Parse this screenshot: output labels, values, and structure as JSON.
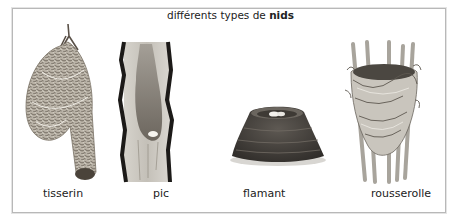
{
  "title": {
    "prefix": "différents types de",
    "emphasis": "nids"
  },
  "nests": [
    {
      "id": "weaver",
      "label": "tisserin",
      "icon": "hanging-woven-nest"
    },
    {
      "id": "woodpecker",
      "label": "pic",
      "icon": "tree-cavity-nest"
    },
    {
      "id": "flamingo",
      "label": "flamant",
      "icon": "mud-mound-nest"
    },
    {
      "id": "reed-warbler",
      "label": "rousserolle",
      "icon": "reed-cup-nest"
    }
  ],
  "colors": {
    "frame_border": "#b8b8b8",
    "text": "#222222",
    "background": "#ffffff"
  }
}
